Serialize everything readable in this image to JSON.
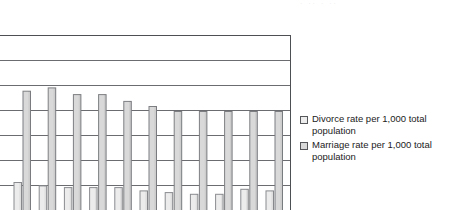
{
  "figure": {
    "top_edge_remnant": "· ·· · ··",
    "plot": {
      "background": "#ffffff",
      "border_color": "#4d4f52",
      "gridline_color": "#6a6c6f",
      "grid": true,
      "gridline_count": 7,
      "x_axis_visible": false,
      "cropped_bottom": true
    }
  },
  "legend": {
    "position": "right",
    "entries": [
      {
        "swatch_name": "legend-swatch-divorce",
        "label": "Divorce rate per 1,000 total population",
        "fill": "#ececed",
        "stroke": "#55575a"
      },
      {
        "swatch_name": "legend-swatch-marriage",
        "label": "Marriage rate per 1,000 total population",
        "fill": "#d9d9da",
        "stroke": "#55575a"
      }
    ]
  },
  "chart_data": {
    "type": "bar",
    "title": "",
    "subtitle": "",
    "xlabel": "",
    "ylabel": "",
    "grid": true,
    "legend_position": "right",
    "axis_labels_visible": false,
    "note": "Scanned grouped bar chart, cropped at bottom and left; axis tick labels are outside the captured region.",
    "categories": [
      "1",
      "2",
      "3",
      "4",
      "5",
      "6",
      "7",
      "8",
      "9",
      "10",
      "11"
    ],
    "ylim": [
      0,
      12
    ],
    "series": [
      {
        "name": "Divorce rate per 1,000 total population",
        "fill": "#ececed",
        "stroke": "#8a8c8f",
        "values": [
          5.0,
          4.8,
          4.7,
          4.7,
          4.7,
          4.5,
          4.4,
          4.3,
          4.3,
          4.6,
          4.5
        ]
      },
      {
        "name": "Marriage rate per 1,000 total population",
        "fill": "#d9d9da",
        "stroke": "#7d7f82",
        "values": [
          10.4,
          10.6,
          10.2,
          10.2,
          9.8,
          9.5,
          9.2,
          9.2,
          9.2,
          9.2,
          9.2
        ]
      }
    ]
  }
}
